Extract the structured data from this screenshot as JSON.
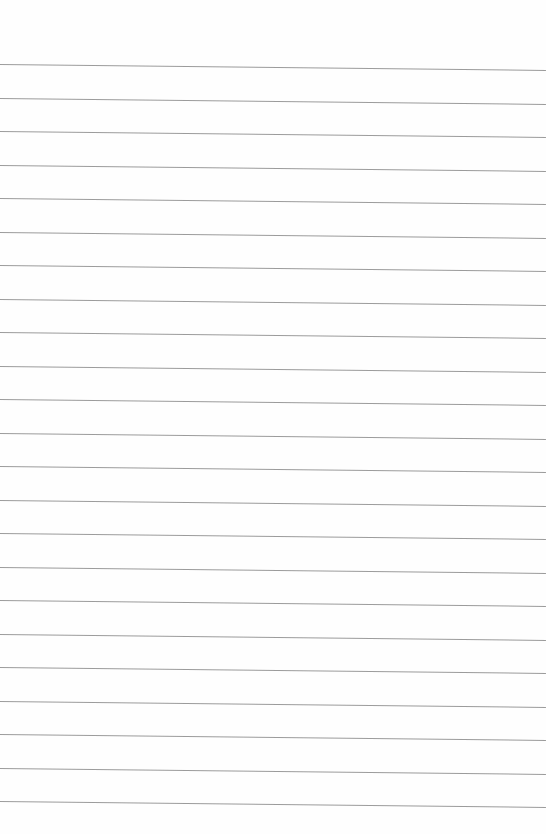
{
  "page": {
    "type": "lined-paper",
    "background_color": "#fefefe",
    "rule_color": "#8a8a8a",
    "rule_count": 23,
    "first_rule_y": 64,
    "rule_spacing": 33.5,
    "rule_slope_px": 6
  }
}
